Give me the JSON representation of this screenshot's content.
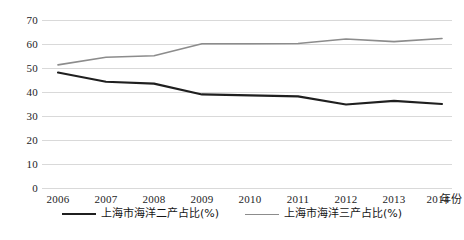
{
  "chart_data": {
    "type": "line",
    "title": "",
    "xlabel": "年份",
    "ylabel": "",
    "categories": [
      "2006",
      "2007",
      "2008",
      "2009",
      "2010",
      "2011",
      "2012",
      "2013",
      "2014"
    ],
    "x": [
      2006,
      2007,
      2008,
      2009,
      2010,
      2011,
      2012,
      2013,
      2014
    ],
    "series": [
      {
        "name": "上海市海洋二产占比(%)",
        "color": "#1f1f1f",
        "values": [
          48.3,
          44.5,
          43.7,
          39.2,
          38.8,
          38.4,
          35.0,
          36.5,
          35.2
        ]
      },
      {
        "name": "上海市海洋三产占比(%)",
        "color": "#8c8c8c",
        "values": [
          51.5,
          54.7,
          55.3,
          60.3,
          60.3,
          60.4,
          62.3,
          61.2,
          62.5
        ]
      }
    ],
    "ylim": [
      0,
      70
    ],
    "yticks": [
      0,
      10,
      20,
      30,
      40,
      50,
      60,
      70
    ],
    "ytick_labels": [
      "0",
      "10",
      "20",
      "30",
      "40",
      "50",
      "60",
      "70"
    ],
    "grid": true,
    "grid_axis": "y",
    "grid_color": "#d9d9d9",
    "legend_position": "bottom",
    "background": "#ffffff"
  },
  "axes": {
    "x_axis_name": "年份"
  },
  "caption": {
    "text": ""
  }
}
